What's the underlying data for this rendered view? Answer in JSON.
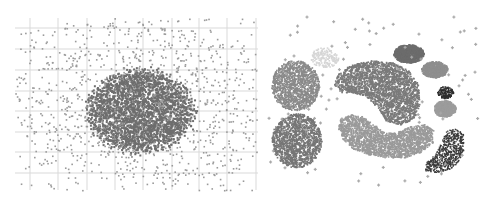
{
  "chart_data": [
    {
      "type": "scatter",
      "title": "",
      "xlabel": "",
      "ylabel": "",
      "grid": true,
      "legend": null,
      "panel": "left",
      "bounds": {
        "x": [
          15,
          258
        ],
        "y": [
          18,
          190
        ]
      },
      "grid_lines": {
        "vertical_px": [
          30,
          58,
          87,
          115,
          143,
          172,
          199,
          227,
          256
        ],
        "horizontal_px": [
          28,
          49,
          70,
          91,
          111,
          132,
          152,
          173
        ],
        "color": "#d9d9d9"
      },
      "series": [
        {
          "name": "dense-cluster",
          "shape": "ellipse",
          "cx": 140,
          "cy": 110,
          "rx": 53,
          "ry": 41,
          "n": 2600,
          "color": "#6e6e6e",
          "dot": 2
        },
        {
          "name": "background-noise",
          "shape": "uniform",
          "x": [
            15,
            258
          ],
          "y": [
            18,
            190
          ],
          "n": 1100,
          "color": "#9a9a9a",
          "dot": 1.6
        }
      ]
    },
    {
      "type": "scatter",
      "title": "",
      "xlabel": "",
      "ylabel": "",
      "grid": false,
      "legend": null,
      "panel": "right",
      "bounds": {
        "x": [
          265,
          480
        ],
        "y": [
          15,
          190
        ]
      },
      "series": [
        {
          "name": "faint-cluster",
          "shape": "ellipse",
          "cx": 324,
          "cy": 57,
          "rx": 14,
          "ry": 10,
          "n": 180,
          "color": "#d6d6d6",
          "dot": 1.6
        },
        {
          "name": "upper-left-blob",
          "shape": "ellipse",
          "cx": 295,
          "cy": 85,
          "rx": 24,
          "ry": 25,
          "n": 1300,
          "color": "#8a8a8a",
          "dot": 1.6
        },
        {
          "name": "lower-left-blob",
          "shape": "ellipse",
          "cx": 296,
          "cy": 140,
          "rx": 25,
          "ry": 27,
          "n": 1400,
          "color": "#767676",
          "dot": 1.6
        },
        {
          "name": "kidney-cluster",
          "shape": "polygon",
          "points": [
            [
              336,
              75
            ],
            [
              350,
              64
            ],
            [
              372,
              60
            ],
            [
              392,
              62
            ],
            [
              408,
              70
            ],
            [
              418,
              84
            ],
            [
              419,
              104
            ],
            [
              414,
              118
            ],
            [
              400,
              124
            ],
            [
              386,
              121
            ],
            [
              378,
              108
            ],
            [
              366,
              96
            ],
            [
              352,
              92
            ],
            [
              340,
              92
            ],
            [
              334,
              84
            ]
          ],
          "n": 2400,
          "color": "#7a7a7a",
          "dot": 1.6
        },
        {
          "name": "banana-cluster",
          "shape": "polygon",
          "points": [
            [
              340,
              118
            ],
            [
              350,
              114
            ],
            [
              362,
              116
            ],
            [
              374,
              124
            ],
            [
              384,
              132
            ],
            [
              396,
              132
            ],
            [
              410,
              126
            ],
            [
              424,
              124
            ],
            [
              433,
              130
            ],
            [
              432,
              142
            ],
            [
              420,
              152
            ],
            [
              404,
              157
            ],
            [
              386,
              157
            ],
            [
              368,
              154
            ],
            [
              352,
              148
            ],
            [
              342,
              138
            ],
            [
              338,
              128
            ]
          ],
          "n": 2100,
          "color": "#9a9a9a",
          "dot": 1.6
        },
        {
          "name": "dark-ellipse",
          "shape": "ellipse",
          "cx": 408,
          "cy": 53,
          "rx": 15,
          "ry": 9,
          "n": 600,
          "color": "#6c6c6c",
          "dot": 1.8,
          "solid": true
        },
        {
          "name": "medium-ellipse",
          "shape": "ellipse",
          "cx": 434,
          "cy": 69,
          "rx": 13,
          "ry": 8,
          "n": 450,
          "color": "#8e8e8e",
          "dot": 1.8,
          "solid": true
        },
        {
          "name": "speckled-cluster",
          "shape": "ellipse",
          "cx": 445,
          "cy": 92,
          "rx": 8,
          "ry": 6,
          "n": 160,
          "color": "#2e2e2e",
          "dot": 1.4
        },
        {
          "name": "light-ellipse",
          "shape": "ellipse",
          "cx": 444,
          "cy": 108,
          "rx": 11,
          "ry": 8,
          "n": 400,
          "color": "#9c9c9c",
          "dot": 1.8,
          "solid": true
        },
        {
          "name": "crescent-cluster",
          "shape": "polygon",
          "points": [
            [
              446,
              130
            ],
            [
              456,
              128
            ],
            [
              463,
              134
            ],
            [
              463,
              150
            ],
            [
              458,
              162
            ],
            [
              448,
              170
            ],
            [
              434,
              172
            ],
            [
              424,
              170
            ],
            [
              426,
              162
            ],
            [
              436,
              152
            ],
            [
              442,
              140
            ]
          ],
          "n": 700,
          "color": "#3a3a3a",
          "dot": 1.3
        },
        {
          "name": "noise-points",
          "shape": "uniform-cross",
          "x": [
            268,
            478
          ],
          "y": [
            16,
            190
          ],
          "n": 95,
          "color": "#a8a8a8",
          "size": 3
        }
      ]
    }
  ]
}
